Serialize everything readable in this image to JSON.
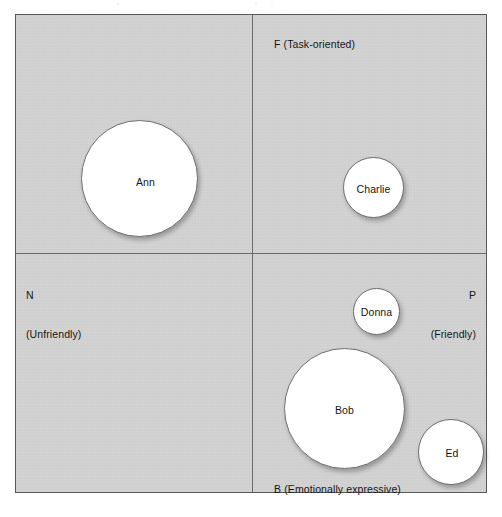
{
  "figure": {
    "kind": "interpersonal-circumplex-bubble-plot",
    "frame_color": "#58585a",
    "field_color": "#d2d2d2",
    "axis_color": "#6b6b6d",
    "bubble_fill": "#ffffff",
    "bubble_stroke": "#6e6e70"
  },
  "axes": {
    "top": {
      "letter": "F",
      "descriptor": "(Task-oriented)",
      "text": "F (Task-oriented)"
    },
    "left": {
      "letter": "N",
      "descriptor": "(Unfriendly)",
      "text": "N (Unfriendly)"
    },
    "right": {
      "letter": "P",
      "descriptor": "(Friendly)",
      "text": "P (Friendly)"
    },
    "bottom": {
      "letter": "B",
      "descriptor": "(Emotionally expressive)",
      "text": "B (Emotionally expressive)"
    }
  },
  "chart_data": {
    "type": "scatter",
    "title": "",
    "xlabel": "N (Unfriendly) — P (Friendly)",
    "ylabel": "B (Emotionally expressive) — F (Task-oriented)",
    "grid": false,
    "legend": null,
    "axis_pole_labels": {
      "top": "F (Task-oriented)",
      "bottom": "B (Emotionally expressive)",
      "left": "N (Unfriendly)",
      "right": "P (Friendly)"
    },
    "xlim": [
      -1,
      1
    ],
    "ylim": [
      -1,
      1
    ],
    "origin_px": {
      "x": 252,
      "y": 253
    },
    "points": [
      {
        "label": "Ann",
        "quadrant": "N-F (Unfriendly / Task-oriented)",
        "x": -0.55,
        "y": 0.38,
        "size_radius_px": 58,
        "center_px": {
          "x": 123,
          "y": 163
        }
      },
      {
        "label": "Charlie",
        "quadrant": "P-F (Friendly / Task-oriented)",
        "x": 0.44,
        "y": 0.34,
        "size_radius_px": 30,
        "center_px": {
          "x": 357,
          "y": 172
        }
      },
      {
        "label": "Donna",
        "quadrant": "P-B (Friendly / Emotionally expressive)",
        "x": 0.46,
        "y": -0.18,
        "size_radius_px": 23,
        "center_px": {
          "x": 361,
          "y": 296
        }
      },
      {
        "label": "Bob",
        "quadrant": "P-B (Friendly / Emotionally expressive)",
        "x": 0.32,
        "y": -0.59,
        "size_radius_px": 60,
        "center_px": {
          "x": 328,
          "y": 393
        }
      },
      {
        "label": "Ed",
        "quadrant": "P-B (Friendly / Emotionally expressive)",
        "x": 0.78,
        "y": -0.77,
        "size_radius_px": 33,
        "center_px": {
          "x": 435,
          "y": 437
        }
      }
    ]
  },
  "bubbles": [
    {
      "name": "Ann"
    },
    {
      "name": "Charlie"
    },
    {
      "name": "Donna"
    },
    {
      "name": "Bob"
    },
    {
      "name": "Ed"
    }
  ]
}
